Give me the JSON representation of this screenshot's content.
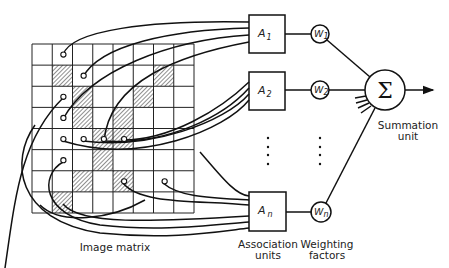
{
  "diagram": {
    "labels": {
      "image_matrix": "Image matrix",
      "association_units_line1": "Association",
      "association_units_line2": "units",
      "weighting_factors_line1": "Weighting",
      "weighting_factors_line2": "factors",
      "summation_unit_line1": "Summation",
      "summation_unit_line2": "unit",
      "sigma_symbol": "Σ"
    },
    "image_matrix": {
      "rows": 8,
      "cols": 8,
      "hatched_cells": [
        [
          1,
          1
        ],
        [
          1,
          6
        ],
        [
          2,
          2
        ],
        [
          2,
          5
        ],
        [
          3,
          2
        ],
        [
          3,
          4
        ],
        [
          4,
          3
        ],
        [
          4,
          4
        ],
        [
          5,
          3
        ],
        [
          6,
          2
        ],
        [
          6,
          4
        ],
        [
          7,
          1
        ]
      ],
      "sample_points": [
        [
          0,
          1
        ],
        [
          1,
          2
        ],
        [
          2,
          1
        ],
        [
          3,
          1
        ],
        [
          4,
          1
        ],
        [
          4,
          2
        ],
        [
          4,
          3
        ],
        [
          4,
          4
        ],
        [
          5,
          1
        ],
        [
          6,
          4
        ],
        [
          6,
          6
        ]
      ]
    },
    "association_units": [
      {
        "name": "A",
        "subscript": "1"
      },
      {
        "name": "A",
        "subscript": "2"
      },
      {
        "name": "A",
        "subscript": "n"
      }
    ],
    "weighting_factors": [
      {
        "name": "W",
        "subscript": "1"
      },
      {
        "name": "W",
        "subscript": "2"
      },
      {
        "name": "W",
        "subscript": "n"
      }
    ],
    "ellipsis": "⋮"
  }
}
